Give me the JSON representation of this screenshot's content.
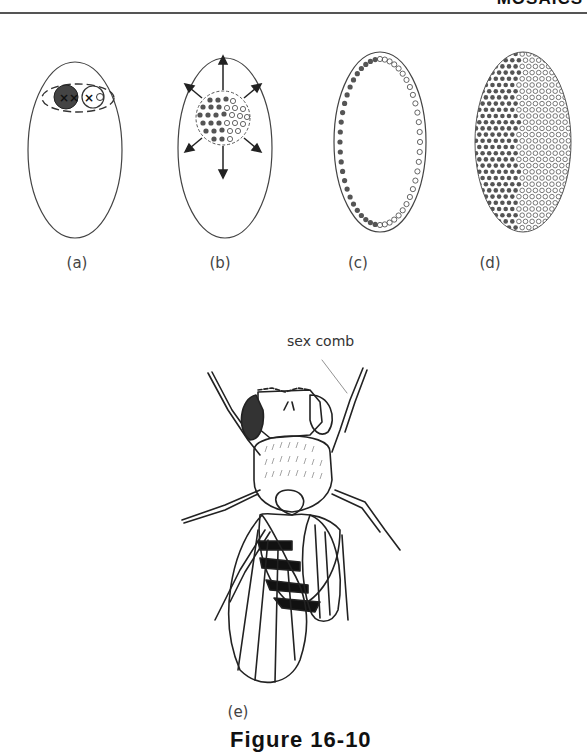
{
  "page": {
    "running_head": "MOSAICS",
    "figure_caption": "Figure 16-10"
  },
  "panels": [
    {
      "id": "a",
      "label": "(a)",
      "description": "Egg with zygote nucleus: XX (dark) and XO (open) chromosomes"
    },
    {
      "id": "b",
      "label": "(b)",
      "description": "Mosaic cluster of dark and open nuclei dividing outward (arrows)"
    },
    {
      "id": "c",
      "label": "(c)",
      "description": "Nuclei migrate to egg periphery; dark on left, open on right"
    },
    {
      "id": "d",
      "label": "(d)",
      "description": "Blastoderm: left half dark nuclei, right half open nuclei"
    },
    {
      "id": "e",
      "label": "(e)",
      "description": "Gynandromorph Drosophila fly drawing"
    }
  ],
  "annotations": {
    "sex_comb": "sex comb"
  },
  "chromosomes": {
    "dark_nucleus": "XX",
    "open_nucleus": "XO"
  },
  "colors": {
    "dark_dot": "#555555",
    "outline": "#333333",
    "background": "#ffffff"
  }
}
